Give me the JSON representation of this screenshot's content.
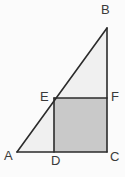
{
  "figure": {
    "kind": "geometry-diagram",
    "background_color": "#fbfbfb",
    "stroke_color": "#2b2b2b",
    "stroke_width": 1.5,
    "triangle": {
      "name": "triangle-ABC",
      "fill_color": "#f0f0f0",
      "vertices": [
        {
          "label": "A",
          "x": 17,
          "y": 152
        },
        {
          "label": "B",
          "x": 107,
          "y": 28
        },
        {
          "label": "C",
          "x": 107,
          "y": 152
        }
      ]
    },
    "square": {
      "name": "square-DEFC",
      "fill_color": "#c9c9c9",
      "vertices": [
        {
          "label": "D",
          "x": 54,
          "y": 152
        },
        {
          "label": "E",
          "x": 54,
          "y": 98
        },
        {
          "label": "F",
          "x": 107,
          "y": 98
        },
        {
          "label": "C",
          "x": 107,
          "y": 152
        }
      ]
    },
    "labels": {
      "A": "A",
      "B": "B",
      "C": "C",
      "D": "D",
      "E": "E",
      "F": "F"
    }
  }
}
